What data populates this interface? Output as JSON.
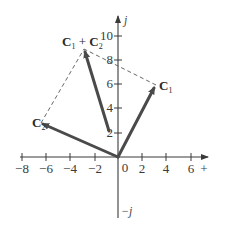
{
  "diagram": {
    "type": "phasor-vector-addition",
    "axes": {
      "horizontal_label": "+",
      "vertical_top_label": "j",
      "vertical_bottom_label": "−j",
      "origin_label": "0",
      "x_ticks": [
        "−8",
        "−6",
        "−4",
        "−2",
        "2",
        "4",
        "6"
      ],
      "y_ticks": [
        "10",
        "8",
        "6",
        "4",
        "2"
      ]
    },
    "vectors": [
      {
        "name": "C1",
        "label_main": "C",
        "label_sub": "1",
        "from": [
          0,
          0
        ],
        "to": [
          3.2,
          6.0
        ],
        "style": "solid-arrow"
      },
      {
        "name": "C2",
        "label_main": "C",
        "label_sub": "2",
        "from": [
          0,
          0
        ],
        "to": [
          -6.4,
          2.8
        ],
        "style": "solid-arrow"
      },
      {
        "name": "C1+C2",
        "label": "C1 + C2",
        "label_parts": [
          "C",
          "1",
          " + ",
          "C",
          "2"
        ],
        "from": [
          -0.8,
          2.2
        ],
        "to": [
          -2.8,
          9.0
        ],
        "style": "solid-arrow"
      }
    ],
    "construction_lines": [
      {
        "from": [
          3.2,
          6.0
        ],
        "to": [
          -2.8,
          9.0
        ],
        "style": "dashed"
      },
      {
        "from": [
          -6.4,
          2.8
        ],
        "to": [
          -2.8,
          9.0
        ],
        "style": "dashed"
      }
    ],
    "colors": {
      "vector": "#4a4a4a",
      "axis": "#3a3a3a",
      "dashed": "#555555"
    }
  }
}
